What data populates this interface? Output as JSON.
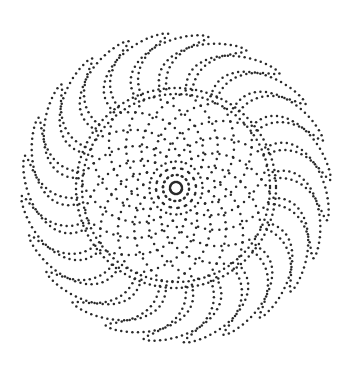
{
  "figure": {
    "width": 357,
    "height": 367,
    "background": "#ffffff",
    "dot_color": "#2a2a2a",
    "dot_radius": 1.25,
    "center": [
      176,
      188
    ],
    "petals": {
      "count": 24,
      "inner_radius": 98,
      "outer_radius": 155,
      "swirl_deg": 26,
      "width_deg": 17,
      "dot_spacing": 5.6
    },
    "disc": {
      "radius": 100,
      "boundary_rings": [
        94,
        100
      ],
      "spiral_count": 16,
      "spiral_twist_deg": 95,
      "dot_spacing": 7.2
    }
  }
}
